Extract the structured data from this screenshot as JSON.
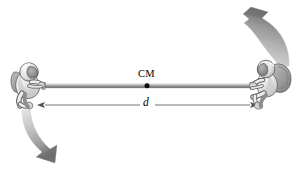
{
  "figure": {
    "type": "physics-diagram",
    "background_color": "#ffffff",
    "width": 299,
    "height": 176,
    "labels": {
      "center_of_mass": "CM",
      "separation_distance": "d"
    },
    "elements": {
      "rope": {
        "name": "tether-rope",
        "color": "#9a9a9a",
        "highlight_color": "#c9c9c9",
        "shadow_color": "#6e6e6e",
        "x_start": 42,
        "x_end": 253,
        "y": 86
      },
      "cm_point": {
        "name": "center-of-mass-dot",
        "color": "#111111",
        "x": 147,
        "y": 86,
        "radius": 2.4
      },
      "dimension_line": {
        "name": "distance-dimension-line",
        "color": "#5a5a5a",
        "x_start": 42,
        "x_end": 253,
        "y": 105,
        "arrowheads": "both"
      },
      "astronaut_left": {
        "name": "astronaut-left",
        "x": 28,
        "y": 86,
        "suit_color": "#f2f2f2",
        "outline_color": "#5d5d5d",
        "shade_color": "#b8b8b8",
        "visor_color": "#8e8e8e"
      },
      "astronaut_right": {
        "name": "astronaut-right",
        "x": 268,
        "y": 84,
        "suit_color": "#f2f2f2",
        "outline_color": "#5d5d5d",
        "shade_color": "#b8b8b8",
        "visor_color": "#8e8e8e",
        "backpack_color": "#9d9d9d"
      },
      "motion_arrow_top_right": {
        "name": "motion-arrow-up",
        "color_start": "#cfcfcf",
        "color_end": "#6d6d6d",
        "direction": "up-left",
        "from_x": 285,
        "from_y": 64,
        "to_x": 242,
        "to_y": 14
      },
      "motion_arrow_bottom_left": {
        "name": "motion-arrow-down",
        "color_start": "#cfcfcf",
        "color_end": "#6d6d6d",
        "direction": "down-right",
        "from_x": 26,
        "from_y": 112,
        "to_x": 52,
        "to_y": 165
      }
    }
  }
}
